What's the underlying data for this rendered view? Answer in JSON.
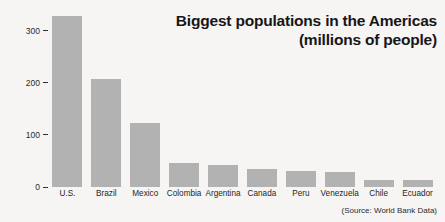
{
  "chart_data": {
    "type": "bar",
    "title": "Biggest populations in the Americas (millions of people)",
    "title_lines": [
      "Biggest populations in the Americas",
      "(millions of people)"
    ],
    "xlabel": "",
    "ylabel": "",
    "ylim": [
      0,
      340
    ],
    "yticks": [
      0,
      100,
      200,
      300
    ],
    "ytick_labels": [
      "0",
      "100",
      "200",
      "300"
    ],
    "grid": false,
    "legend": null,
    "source_note": "(Source: World Bank Data)",
    "units": "millions of people",
    "categories": [
      "U.S.",
      "Brazil",
      "Mexico",
      "Colombia",
      "Argentina",
      "Canada",
      "Peru",
      "Venezuela",
      "Chile",
      "Ecuador"
    ],
    "values": [
      328,
      207,
      123,
      46,
      43,
      35,
      30,
      29,
      14,
      13
    ],
    "bar_color": "#b2b2b2",
    "background_color": "#f6f5f3",
    "text_color": "#16161a"
  }
}
